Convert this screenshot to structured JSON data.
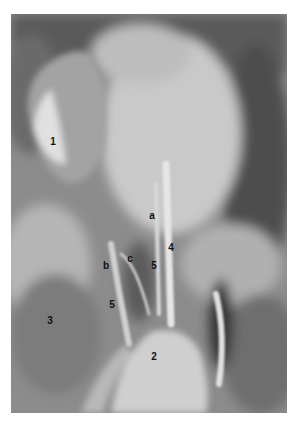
{
  "figure": {
    "labels": [
      {
        "text": "1",
        "x": 53,
        "y": 142
      },
      {
        "text": "a",
        "x": 152,
        "y": 216
      },
      {
        "text": "4",
        "x": 171,
        "y": 248
      },
      {
        "text": "c",
        "x": 130,
        "y": 259
      },
      {
        "text": "b",
        "x": 106,
        "y": 266
      },
      {
        "text": "5",
        "x": 154,
        "y": 266
      },
      {
        "text": "5",
        "x": 112,
        "y": 305
      },
      {
        "text": "3",
        "x": 50,
        "y": 321
      },
      {
        "text": "2",
        "x": 154,
        "y": 357
      }
    ]
  }
}
